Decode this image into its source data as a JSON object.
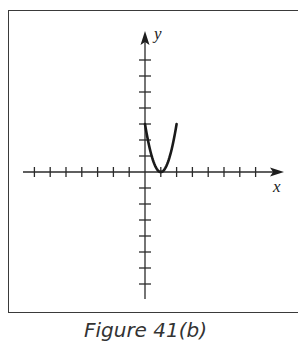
{
  "figure": {
    "caption": "Figure 41(b)",
    "x_axis_label": "x",
    "y_axis_label": "y"
  },
  "chart_data": {
    "type": "line",
    "title": "",
    "caption": "Figure 41(b)",
    "xlabel": "x",
    "ylabel": "y",
    "series": [
      {
        "name": "y = 3(x-1)^2",
        "x": [
          0,
          0.25,
          0.5,
          0.75,
          1,
          1.25,
          1.5,
          1.75,
          2
        ],
        "values": [
          3,
          1.6875,
          0.75,
          0.1875,
          0,
          0.1875,
          0.75,
          1.6875,
          3
        ]
      }
    ],
    "xlim": [
      -8,
      9
    ],
    "ylim": [
      -8,
      9
    ],
    "x_ticks": [
      -7,
      -6,
      -5,
      -4,
      -3,
      -2,
      -1,
      1,
      2,
      3,
      4,
      5,
      6,
      7
    ],
    "y_ticks": [
      -7,
      -6,
      -5,
      -4,
      -3,
      -2,
      -1,
      1,
      2,
      3,
      4,
      5,
      6,
      7
    ],
    "grid": false,
    "legend": "none",
    "tick_labels": "none"
  }
}
